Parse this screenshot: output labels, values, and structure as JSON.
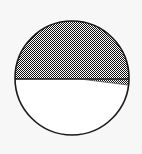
{
  "figure": {
    "type": "geometric-diagram",
    "background_color": "#f7f7f7",
    "canvas": {
      "width": 142,
      "height": 154
    }
  },
  "circle": {
    "label": "circle-outline",
    "center_x": 72,
    "center_y": 78,
    "radius": 57,
    "stroke_color": "#1a1a1a",
    "stroke_width": 1.6,
    "fill_color": "#ffffff"
  },
  "segment": {
    "label": "shaded-upper-segment",
    "description": "Region of the circle above the horizontal chord, filled with a gray dither pattern",
    "chord_y": 79,
    "chord_left_x": 15,
    "chord_right_x": 129,
    "fill_color": "#808080",
    "fill_pattern": "checkerboard-dither",
    "fill_opacity": 1
  },
  "chord": {
    "label": "horizontal-chord",
    "x1": 15,
    "y1": 79,
    "x2": 129,
    "y2": 79,
    "stroke_color": "#1a1a1a",
    "stroke_width": 1.4
  },
  "wedge": {
    "label": "thin-sector-wedge",
    "description": "Narrow shaded triangular sliver below the chord, apex near the circle center widening to the right rim",
    "apex_x": 80,
    "apex_y": 79,
    "right_top_x": 129,
    "right_top_y": 79,
    "right_bottom_x": 128,
    "right_bottom_y": 85,
    "fill_color": "#808080",
    "fill_pattern": "checkerboard-dither"
  },
  "lower_region": {
    "label": "unshaded-lower-segment",
    "fill_color": "#ffffff"
  }
}
